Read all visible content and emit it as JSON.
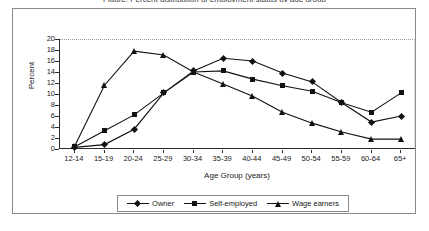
{
  "title_sliver": "Figure: Percent distribution of employment status by age group",
  "axes": {
    "ylabel": "Percent",
    "xlabel": "Age Group (years)",
    "yticks": [
      "0",
      "2",
      "4",
      "6",
      "8",
      "10",
      "12",
      "14",
      "16",
      "18",
      "20"
    ]
  },
  "legend": {
    "items": [
      {
        "label": "Owner",
        "marker": "diamond-marker-icon"
      },
      {
        "label": "Self-employed",
        "marker": "square-marker-icon"
      },
      {
        "label": "Wage earners",
        "marker": "triangle-marker-icon"
      }
    ]
  },
  "chart_data": {
    "type": "line",
    "title": "",
    "xlabel": "Age Group (years)",
    "ylabel": "Percent",
    "ylim": [
      0,
      20
    ],
    "ytick_step": 2,
    "grid": false,
    "legend_position": "bottom",
    "categories": [
      "12-14",
      "15-19",
      "20-24",
      "25-29",
      "30-34",
      "35-39",
      "40-44",
      "45-49",
      "50-54",
      "55-59",
      "60-64",
      "65+"
    ],
    "series": [
      {
        "name": "Owner",
        "marker": "diamond",
        "values": [
          0.3,
          0.8,
          3.6,
          10.2,
          14.2,
          16.5,
          16.0,
          13.8,
          12.2,
          8.4,
          4.9,
          6.0
        ]
      },
      {
        "name": "Self-employed",
        "marker": "square",
        "values": [
          0.4,
          3.3,
          6.2,
          10.2,
          14.0,
          14.2,
          12.7,
          11.5,
          10.5,
          8.4,
          6.7,
          10.2
        ]
      },
      {
        "name": "Wage earners",
        "marker": "triangle",
        "values": [
          0.6,
          11.6,
          17.8,
          17.1,
          14.0,
          11.8,
          9.6,
          6.7,
          4.7,
          3.1,
          1.8,
          1.8
        ]
      }
    ]
  },
  "colors": {
    "series_line": "#111111",
    "axis": "#2b2b2b",
    "frame": "#8a8a8a",
    "background": "#ffffff"
  }
}
